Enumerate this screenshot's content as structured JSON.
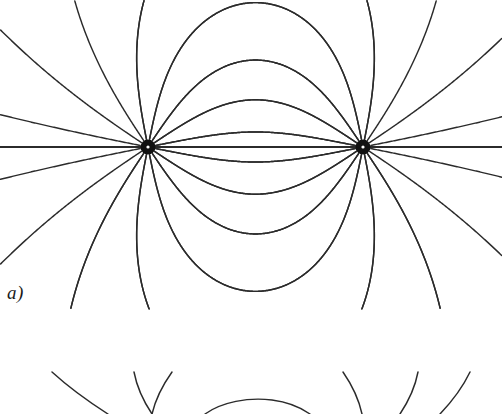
{
  "figure": {
    "kind": "electric-dipole-field-line-diagram",
    "width": 502,
    "height": 414,
    "background_color": "#ffffff",
    "line_color": "#2b2b2b",
    "axis_color": "#2b2b2b",
    "pole_fill_color": "#111111",
    "pole_center_color": "#ffffff",
    "panels": [
      {
        "id": "panel-a",
        "label": "a)",
        "label_x": 7,
        "label_y": 283,
        "description": "Field lines of an electric dipole: two point charges on a horizontal axis"
      },
      {
        "id": "panel-b",
        "label": "",
        "description": "Top edge of the following panel, cropped at the bottom of the image"
      }
    ]
  },
  "chart_data": {
    "type": "line",
    "title": "",
    "xlabel": "",
    "ylabel": "",
    "grid": false,
    "legend": null,
    "xlim": [
      0,
      502
    ],
    "ylim": [
      0,
      414
    ],
    "poles": [
      {
        "name": "left-pole",
        "x": 148,
        "y": 147,
        "radius": 7.5,
        "center_dot_radius": 1.6
      },
      {
        "name": "right-pole",
        "x": 363,
        "y": 147,
        "radius": 7.5,
        "center_dot_radius": 1.6
      }
    ],
    "axis_segment": {
      "x1": 0,
      "y1": 147,
      "x2": 502,
      "y2": 147
    },
    "inner_arc_apex_y_above": [
      38,
      73,
      110
    ],
    "inner_arc_apex_y_below": [
      183,
      220,
      255
    ],
    "lines_per_pole": 16,
    "series": [
      {
        "name": "inner-arcs-upper",
        "count": 3
      },
      {
        "name": "inner-arcs-lower",
        "count": 3
      },
      {
        "name": "outer-arcs-upper",
        "count": 5
      },
      {
        "name": "outer-arcs-lower",
        "count": 5
      },
      {
        "name": "axis",
        "count": 1
      },
      {
        "name": "panel-b-upper-lines",
        "count": 7
      }
    ]
  }
}
